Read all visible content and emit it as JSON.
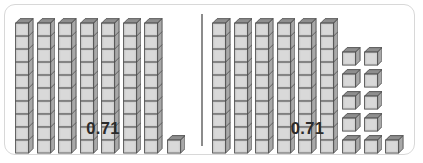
{
  "figure": {
    "type": "base-ten-blocks-comparison",
    "border_color": "#d8d8d8",
    "divider_color": "#8c8c8c",
    "background_color": "#ffffff"
  },
  "block_style": {
    "front_face_color": "#d0d0d0",
    "top_face_color": "#8e8e8e",
    "side_face_color": "#a8a8a8",
    "outline_color": "#4d4d4d",
    "unit_size_px": 13,
    "depth_px": 4.5,
    "segments_per_rod": 10
  },
  "panels": [
    {
      "id": "left",
      "value": "0.71",
      "rods": 7,
      "unit_cubes": 1,
      "rod_value_each": 0.1,
      "cube_value_each": 0.01,
      "cube_layout": {
        "rows": [
          1
        ],
        "description": "single unit cube aligned to the bottom of the rods"
      }
    },
    {
      "id": "right",
      "value": "0.71",
      "rods": 6,
      "unit_cubes": 11,
      "rod_value_each": 0.1,
      "cube_value_each": 0.01,
      "cube_layout": {
        "rows": [
          2,
          2,
          2,
          2,
          3
        ],
        "description": "eleven unit cubes stacked in five rows, bottom row of three"
      }
    }
  ],
  "chart_data": {
    "type": "bar",
    "categories": [
      "Model A",
      "Model B"
    ],
    "series": [
      {
        "name": "Tenths rods (0.1 each)",
        "values": [
          7,
          6
        ]
      },
      {
        "name": "Hundredths cubes (0.01 each)",
        "values": [
          1,
          11
        ]
      }
    ],
    "totals": [
      0.71,
      0.71
    ],
    "xlabel": "",
    "ylabel": "Place value blocks",
    "grid": false,
    "legend": "none"
  }
}
